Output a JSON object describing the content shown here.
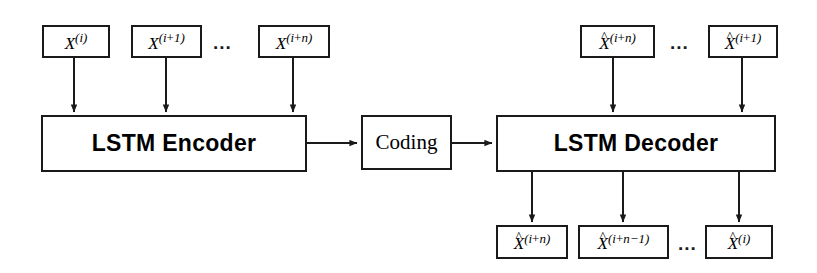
{
  "diagram": {
    "type": "block-diagram",
    "background": "#ffffff",
    "stroke": "#1a1a1a"
  },
  "blocks": {
    "encoder": {
      "label": "LSTM Encoder"
    },
    "coding": {
      "label": "Coding"
    },
    "decoder": {
      "label": "LSTM Decoder"
    }
  },
  "inputs": {
    "ellipsis": "...",
    "items": [
      {
        "base": "X",
        "hat": "",
        "sup_pre": "(i",
        "sup_op": "",
        "sup_post": ")"
      },
      {
        "base": "X",
        "hat": "",
        "sup_pre": "(i",
        "sup_op": "+",
        "sup_post": "1)"
      },
      {
        "base": "X",
        "hat": "",
        "sup_pre": "(i",
        "sup_op": "+",
        "sup_post": "n)"
      }
    ]
  },
  "decoder_inputs": {
    "ellipsis": "...",
    "items": [
      {
        "base": "X",
        "hat": "^",
        "sup_pre": "(i",
        "sup_op": "+",
        "sup_post": "n)"
      },
      {
        "base": "X",
        "hat": "^",
        "sup_pre": "(i",
        "sup_op": "+",
        "sup_post": "1)"
      }
    ]
  },
  "outputs": {
    "ellipsis": "...",
    "items": [
      {
        "base": "X",
        "hat": "^",
        "sup_pre": "(i",
        "sup_op": "+",
        "sup_post": "n)"
      },
      {
        "base": "X",
        "hat": "^",
        "sup_pre": "(i",
        "sup_op": "+",
        "sup_post": "n−1)"
      },
      {
        "base": "X",
        "hat": "^",
        "sup_pre": "(i",
        "sup_op": "",
        "sup_post": ")"
      }
    ]
  }
}
